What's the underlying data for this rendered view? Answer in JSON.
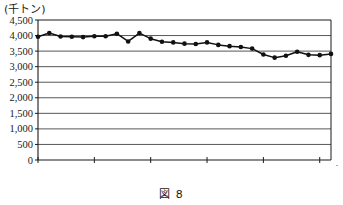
{
  "figure": {
    "unit_label": "(千トン)",
    "caption": "図 8",
    "x_axis_unit": "年"
  },
  "chart_data": {
    "type": "line",
    "title": "",
    "subtitle": "",
    "xlabel": "年",
    "ylabel": "(千トン)",
    "ylim": [
      0,
      4500
    ],
    "xlim": [
      1990,
      2016
    ],
    "grid": true,
    "legend": false,
    "marker": "filled-circle",
    "y_ticks": [
      0,
      500,
      1000,
      1500,
      2000,
      2500,
      3000,
      3500,
      4000,
      4500
    ],
    "y_tick_labels": [
      "0",
      "500",
      "1,000",
      "1,500",
      "2,000",
      "2,500",
      "3,000",
      "3,500",
      "4,000",
      "4,500"
    ],
    "x_ticks": [
      1990,
      1995,
      2000,
      2005,
      2010,
      2015
    ],
    "x_tick_labels": [
      "1990",
      "1995",
      "2000",
      "2005",
      "2010",
      "2015"
    ],
    "x": [
      1990,
      1991,
      1992,
      1993,
      1994,
      1995,
      1996,
      1997,
      1998,
      1999,
      2000,
      2001,
      2002,
      2003,
      2004,
      2005,
      2006,
      2007,
      2008,
      2009,
      2010,
      2011,
      2012,
      2013,
      2014,
      2015,
      2016
    ],
    "values": [
      3960,
      4080,
      3970,
      3960,
      3950,
      3980,
      3980,
      4060,
      3810,
      4080,
      3900,
      3800,
      3780,
      3740,
      3730,
      3780,
      3700,
      3660,
      3630,
      3580,
      3390,
      3290,
      3350,
      3480,
      3380,
      3370,
      3410
    ],
    "series": [
      {
        "name": "漁業・養殖業生産量",
        "values": [
          3960,
          4080,
          3970,
          3960,
          3950,
          3980,
          3980,
          4060,
          3810,
          4080,
          3900,
          3800,
          3780,
          3740,
          3730,
          3780,
          3700,
          3660,
          3630,
          3580,
          3390,
          3290,
          3350,
          3480,
          3380,
          3370,
          3410
        ]
      }
    ]
  }
}
